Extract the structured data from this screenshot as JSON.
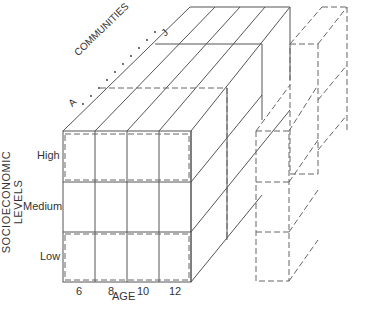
{
  "diagram": {
    "title": "",
    "axes": {
      "x_label": "AGE",
      "y_label": "SOCIOECONOMIC LEVELS",
      "z_label": "COMMUNITIES",
      "z_start": "A",
      "z_end": "J"
    },
    "age_ticks": [
      "6",
      "8",
      "10",
      "12"
    ],
    "levels": [
      "High",
      "Medium",
      "Low"
    ],
    "colors": {
      "line": "#555555",
      "background": "#ffffff"
    }
  }
}
